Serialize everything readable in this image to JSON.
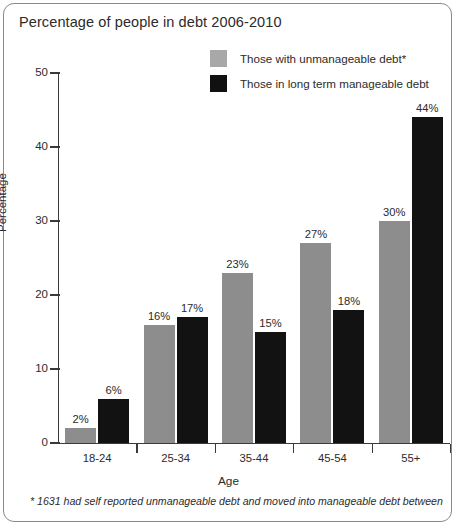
{
  "chart_data": {
    "type": "bar",
    "title": "Percentage of people in debt 2006-2010",
    "xlabel": "Age",
    "ylabel": "Percentage",
    "ylim": [
      0,
      50
    ],
    "yticks": [
      0,
      10,
      20,
      30,
      40,
      50
    ],
    "grid": false,
    "legend_position": "top-right",
    "categories": [
      "18-24",
      "25-34",
      "35-44",
      "45-54",
      "55+"
    ],
    "series": [
      {
        "name": "Those with unmanageable debt*",
        "color": "#8d8d8d",
        "values": [
          2,
          16,
          23,
          27,
          30
        ],
        "labels": [
          "2%",
          "16%",
          "23%",
          "27%",
          "30%"
        ]
      },
      {
        "name": "Those in long term manageable debt",
        "color": "#121212",
        "values": [
          6,
          17,
          15,
          18,
          44
        ],
        "labels": [
          "6%",
          "17%",
          "15%",
          "18%",
          "44%"
        ]
      }
    ],
    "annotations": [
      "* 1631 had self reported unmanageable debt and moved into manageable debt between"
    ]
  },
  "footnote": "* 1631 had self reported unmanageable debt and moved into manageable debt between"
}
